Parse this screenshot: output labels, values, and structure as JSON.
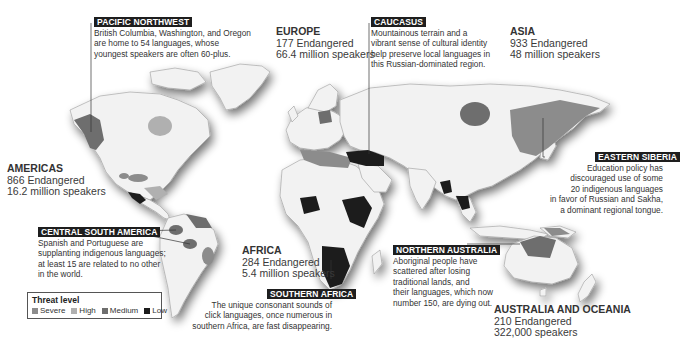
{
  "colors": {
    "land": "#f2f2f2",
    "border": "#9a9a9a",
    "severe": "#8c8c8c",
    "high": "#b0b0b0",
    "medium": "#6e6e6e",
    "low": "#1c1c1c",
    "label_bg": "#1e1e1e"
  },
  "regions": {
    "americas": {
      "name": "AMERICAS",
      "endangered": "866 Endangered",
      "speakers": "16.2 million speakers"
    },
    "europe": {
      "name": "EUROPE",
      "endangered": "177 Endangered",
      "speakers": "66.4 million speakers"
    },
    "asia": {
      "name": "ASIA",
      "endangered": "933 Endangered",
      "speakers": "48 million speakers"
    },
    "africa": {
      "name": "AFRICA",
      "endangered": "284 Endangered",
      "speakers": "5.4 million speakers"
    },
    "oceania": {
      "name": "AUSTRALIA AND OCEANIA",
      "endangered": "210 Endangered",
      "speakers": "322,000 speakers"
    }
  },
  "callouts": {
    "pacific_northwest": {
      "title": "PACIFIC NORTHWEST",
      "lines": [
        "British Columbia, Washington, and Oregon",
        "are home to 54 languages, whose",
        "youngest speakers are often 60-plus."
      ]
    },
    "caucasus": {
      "title": "CAUCASUS",
      "lines": [
        "Mountainous terrain and a",
        "vibrant sense of cultural identity",
        "help preserve local languages in",
        "this Russian-dominated region."
      ]
    },
    "eastern_siberia": {
      "title": "EASTERN SIBERIA",
      "lines": [
        "Education policy has",
        "discouraged use of some",
        "20 indigenous languages",
        "in favor of Russian and Sakha,",
        "a dominant regional tongue."
      ]
    },
    "central_south_america": {
      "title": "CENTRAL SOUTH AMERICA",
      "lines": [
        "Spanish and Portuguese are",
        "supplanting indigenous languages;",
        "at least 15 are related to no other",
        "in the world."
      ]
    },
    "southern_africa": {
      "title": "SOUTHERN AFRICA",
      "lines": [
        "The unique consonant sounds of",
        "click languages, once numerous in",
        "southern Africa, are fast disappearing."
      ]
    },
    "northern_australia": {
      "title": "NORTHERN AUSTRALIA",
      "lines": [
        "Aboriginal people have",
        "scattered after losing",
        "traditional lands, and",
        "their languages, which now",
        "number 150, are dying out."
      ]
    }
  },
  "legend": {
    "title": "Threat level",
    "items": [
      {
        "label": "Severe",
        "color": "#8c8c8c"
      },
      {
        "label": "High",
        "color": "#b0b0b0"
      },
      {
        "label": "Medium",
        "color": "#6e6e6e"
      },
      {
        "label": "Low",
        "color": "#1c1c1c"
      }
    ]
  }
}
